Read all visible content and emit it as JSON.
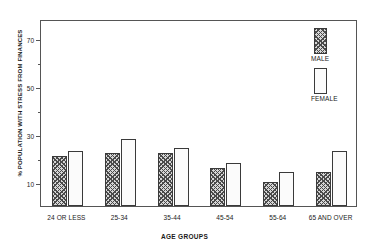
{
  "chart_data": {
    "type": "bar",
    "title": "",
    "xlabel": "AGE GROUPS",
    "ylabel": "% POPULATION WITH STRESS FROM FINANCES",
    "categories": [
      "24 OR LESS",
      "25-34",
      "35-44",
      "45-54",
      "55-64",
      "65 AND OVER"
    ],
    "series": [
      {
        "name": "MALE",
        "values": [
          21,
          22,
          22,
          16,
          10,
          14
        ]
      },
      {
        "name": "FEMALE",
        "values": [
          23,
          28,
          24,
          18,
          14,
          23
        ]
      }
    ],
    "ylim": [
      0,
      78
    ],
    "yticks_major": [
      10,
      30,
      50,
      70
    ],
    "yticks_minor": [
      20,
      40,
      60
    ],
    "ytick_labels": [
      "10",
      "30",
      "50",
      "70"
    ],
    "grid": false,
    "legend_position": "right-top",
    "colors": {
      "male_fill": "#d6d6d6",
      "male_hatch": "#4a4a4a",
      "female_fill": "#fbfbfb",
      "female_stipple": "#bdbdbd",
      "axis": "#555555",
      "bar_outline": "#3a3a3a",
      "text": "#1a1a1a"
    }
  }
}
